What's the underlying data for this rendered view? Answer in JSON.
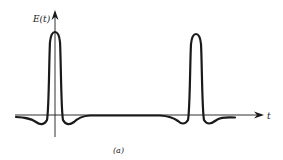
{
  "figure": {
    "y_axis_label": "E(t)",
    "x_axis_label": "t",
    "caption": "(a)",
    "stroke_color": "#1a1a1a",
    "pulses": [
      {
        "name": "pulse-1",
        "center_x": 55
      },
      {
        "name": "pulse-2",
        "center_x": 196
      }
    ]
  }
}
